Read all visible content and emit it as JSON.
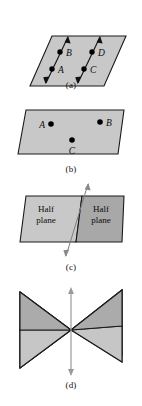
{
  "figure": {
    "background_color": "#ffffff",
    "width": 142,
    "height": 406
  },
  "colors": {
    "plane_light": "#c8c8c8",
    "plane_mid": "#bdbdbd",
    "plane_dark": "#a8a8a8",
    "outline": "#1a1a1a",
    "point": "#000000",
    "arrow": "#111111",
    "axis": "#9a9a9a",
    "text": "#0d0d0d"
  },
  "panels": [
    {
      "id": "a",
      "caption": "(a)",
      "description": "Parallelogram plane containing two parallel double-headed arrows with points A, B on the left line and C, D on the right line",
      "shape": "parallelogram",
      "fill": "#c8c8c8",
      "points": [
        {
          "label": "A",
          "x": 52,
          "y": 55,
          "label_x": 58,
          "label_y": 59,
          "anchor": "start"
        },
        {
          "label": "B",
          "x": 60,
          "y": 38,
          "label_x": 66,
          "label_y": 42,
          "anchor": "start"
        },
        {
          "label": "C",
          "x": 84,
          "y": 55,
          "label_x": 90,
          "label_y": 59,
          "anchor": "start"
        },
        {
          "label": "D",
          "x": 92,
          "y": 38,
          "label_x": 98,
          "label_y": 42,
          "anchor": "start"
        }
      ],
      "lines": [
        {
          "name": "line-AB",
          "x1": 46,
          "y1": 69,
          "x2": 68,
          "y2": 23,
          "double_headed": true
        },
        {
          "name": "line-CD",
          "x1": 78,
          "y1": 69,
          "x2": 100,
          "y2": 23,
          "double_headed": true
        }
      ]
    },
    {
      "id": "b",
      "caption": "(b)",
      "description": "Parallelogram plane containing three labelled points A, B and C",
      "shape": "parallelogram",
      "fill": "#c8c8c8",
      "points": [
        {
          "label": "A",
          "x": 51,
          "y": 20,
          "label_x": 45,
          "label_y": 24,
          "anchor": "end"
        },
        {
          "label": "B",
          "x": 100,
          "y": 18,
          "label_x": 106,
          "label_y": 22,
          "anchor": "start"
        },
        {
          "label": "C",
          "x": 72,
          "y": 36,
          "label_x": 72,
          "label_y": 50,
          "anchor": "middle"
        }
      ]
    },
    {
      "id": "c",
      "caption": "(c)",
      "description": "A plane divided by a slanted line into two half planes, left lighter and right darker",
      "shape": "parallelogram-split",
      "left_fill": "#c8c8c8",
      "right_fill": "#a8a8a8",
      "left_label_line1": "Half",
      "left_label_line2": "plane",
      "right_label_line1": "Half",
      "right_label_line2": "plane",
      "divider": {
        "name": "dividing-line",
        "x1": 88,
        "y1": 2,
        "x2": 66,
        "y2": 74,
        "double_headed": true
      }
    },
    {
      "id": "d",
      "caption": "(d)",
      "description": "Two planes intersecting in a bowtie shape with a vertical line of intersection drawn through the centre",
      "shape": "two-intersecting-planes",
      "fill_upper": "#b5b5b5",
      "fill_lower": "#c2c2c2",
      "axis": {
        "name": "intersection-line",
        "x1": 71,
        "y1": 2,
        "x2": 71,
        "y2": 88,
        "double_headed": true
      }
    }
  ]
}
